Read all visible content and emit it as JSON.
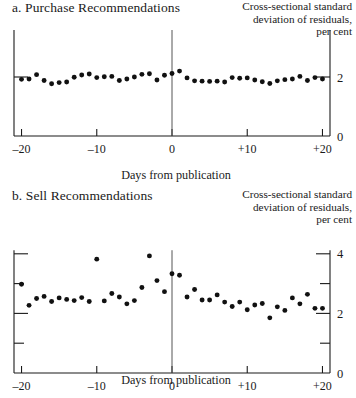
{
  "figure": {
    "xlabel": "Days from publication",
    "ylabel_caption": "Cross-sectional standard\ndeviation of residuals,\nper cent"
  },
  "panel_a": {
    "title": "a. Purchase Recommendations",
    "xlabel": "Days from publication",
    "ylabel_caption": "Cross-sectional standard\ndeviation of residuals,\nper cent",
    "xticklabels": [
      "–20",
      "–10",
      "0",
      "+10",
      "+20"
    ],
    "yticklabels": [
      "0",
      "2"
    ]
  },
  "panel_b": {
    "title": "b. Sell Recommendations",
    "xlabel": "Days from publication",
    "ylabel_caption": "Cross-sectional standard\ndeviation of residuals,\nper cent",
    "xticklabels": [
      "–20",
      "–10",
      "0",
      "+10",
      "+20"
    ],
    "yticklabels": [
      "0",
      "2",
      "4"
    ]
  },
  "chart_data": [
    {
      "type": "scatter",
      "title": "a. Purchase Recommendations",
      "xlabel": "Days from publication",
      "ylabel": "Cross-sectional standard deviation of residuals, per cent",
      "xlim": [
        -21,
        21
      ],
      "ylim": [
        0,
        4
      ],
      "xticks": [
        -20,
        -10,
        0,
        10,
        20
      ],
      "xticklabels": [
        "–20",
        "–10",
        "0",
        "+10",
        "+20"
      ],
      "yticks": [
        0,
        2,
        4
      ],
      "yticklabels": [
        "0",
        "2",
        "4"
      ],
      "yticklabels_shown": [
        "0",
        "2"
      ],
      "grid": false,
      "legend": false,
      "event_line_x": 0,
      "x": [
        -20,
        -19,
        -18,
        -17,
        -16,
        -15,
        -14,
        -13,
        -12,
        -11,
        -10,
        -9,
        -8,
        -7,
        -6,
        -5,
        -4,
        -3,
        -2,
        -1,
        0,
        1,
        2,
        3,
        4,
        5,
        6,
        7,
        8,
        9,
        10,
        11,
        12,
        13,
        14,
        15,
        16,
        17,
        18,
        19,
        20
      ],
      "values": [
        1.92,
        1.93,
        2.08,
        1.88,
        1.77,
        1.81,
        1.83,
        1.99,
        2.07,
        2.1,
        1.98,
        2.01,
        2.02,
        1.88,
        1.93,
        2.0,
        2.09,
        2.11,
        1.9,
        2.06,
        2.12,
        2.2,
        1.97,
        1.87,
        1.86,
        1.85,
        1.86,
        1.83,
        1.98,
        1.96,
        1.97,
        1.9,
        1.84,
        1.78,
        1.87,
        1.91,
        1.93,
        2.02,
        1.88,
        1.98,
        1.93
      ]
    },
    {
      "type": "scatter",
      "title": "b. Sell Recommendations",
      "xlabel": "Days from publication",
      "ylabel": "Cross-sectional standard deviation of residuals, per cent",
      "xlim": [
        -21,
        21
      ],
      "ylim": [
        0,
        4
      ],
      "xticks": [
        -20,
        -10,
        0,
        10,
        20
      ],
      "xticklabels": [
        "–20",
        "–10",
        "0",
        "+10",
        "+20"
      ],
      "yticks": [
        0,
        1,
        2,
        3,
        4
      ],
      "yticklabels": [
        "0",
        "2",
        "4"
      ],
      "grid": false,
      "legend": false,
      "event_line_x": 0,
      "x": [
        -20,
        -19,
        -18,
        -17,
        -16,
        -15,
        -14,
        -13,
        -12,
        -11,
        -10,
        -9,
        -8,
        -7,
        -6,
        -5,
        -4,
        -3,
        -2,
        -1,
        0,
        1,
        2,
        3,
        4,
        5,
        6,
        7,
        8,
        9,
        10,
        11,
        12,
        13,
        14,
        15,
        16,
        17,
        18,
        19,
        20
      ],
      "values": [
        2.98,
        2.27,
        2.5,
        2.57,
        2.4,
        2.52,
        2.47,
        2.43,
        2.53,
        2.4,
        3.82,
        2.42,
        2.67,
        2.55,
        2.32,
        2.43,
        2.87,
        3.93,
        3.1,
        2.73,
        3.33,
        3.28,
        2.55,
        2.8,
        2.45,
        2.45,
        2.62,
        2.38,
        2.23,
        2.38,
        2.12,
        2.28,
        2.33,
        1.85,
        2.22,
        2.1,
        2.52,
        2.32,
        2.64,
        2.17,
        2.17
      ]
    }
  ]
}
